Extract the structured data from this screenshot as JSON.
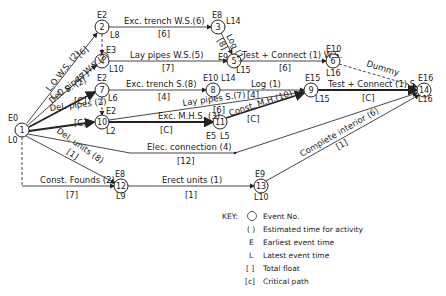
{
  "diagram": {
    "type": "activity-on-arrow network (critical path analysis)",
    "nodes": [
      {
        "id": "1",
        "e": "E0",
        "l": "L0",
        "x": 22,
        "y": 130
      },
      {
        "id": "2",
        "e": "E2",
        "l": "L8",
        "x": 102,
        "y": 27
      },
      {
        "id": "4",
        "e": "E3",
        "l": "L10",
        "x": 102,
        "y": 61
      },
      {
        "id": "7",
        "e": "E2",
        "l": "L6",
        "x": 102,
        "y": 90
      },
      {
        "id": "10",
        "e": "E2",
        "l": "L2",
        "x": 102,
        "y": 122
      },
      {
        "id": "3",
        "e": "E8",
        "l": "L14",
        "x": 218,
        "y": 27
      },
      {
        "id": "5",
        "e": "E9",
        "l": "L15",
        "x": 234,
        "y": 61
      },
      {
        "id": "8",
        "e": "E10",
        "l": "L14",
        "x": 213,
        "y": 90
      },
      {
        "id": "11",
        "e": "E5",
        "l": "L5",
        "x": 220,
        "y": 122
      },
      {
        "id": "6",
        "e": "E10",
        "l": "L16",
        "x": 333,
        "y": 61
      },
      {
        "id": "9",
        "e": "E15",
        "l": "L15",
        "x": 311,
        "y": 90
      },
      {
        "id": "14",
        "e": "E16",
        "l": "L16",
        "x": 424,
        "y": 90
      },
      {
        "id": "12",
        "e": "E8",
        "l": "L9",
        "x": 121,
        "y": 186
      },
      {
        "id": "13",
        "e": "E9",
        "l": "L10",
        "x": 261,
        "y": 186
      }
    ],
    "activities": [
      {
        "from": "1",
        "to": "2",
        "label": "L.O.W.S. (2)",
        "float": "[6]"
      },
      {
        "from": "1",
        "to": "4",
        "label": "Del. pipes W.S.(3)",
        "float": "[7]"
      },
      {
        "from": "1",
        "to": "7",
        "label": "L.O.S. (2)",
        "float": "[C]"
      },
      {
        "from": "1",
        "to": "10",
        "label": "Del. pipes (2)",
        "float": "[C]"
      },
      {
        "from": "1",
        "to": "12",
        "label": "Del. units (8)",
        "float": "[1]"
      },
      {
        "from": "1",
        "to": "12",
        "label": "Const. Founds (2)",
        "float": "[7]"
      },
      {
        "from": "2",
        "to": "3",
        "label": "Exc. trench W.S.(6)",
        "float": "[6]"
      },
      {
        "from": "4",
        "to": "5",
        "label": "Lay pipes W.S.(5)",
        "float": "[7]"
      },
      {
        "from": "3",
        "to": "5",
        "label": "Log (1)",
        "float": "[8]"
      },
      {
        "from": "5",
        "to": "6",
        "label": "Test + Connect (1) W.S.",
        "float": "[6]"
      },
      {
        "from": "6",
        "to": "14",
        "label": "Dummy",
        "float": ""
      },
      {
        "from": "7",
        "to": "8",
        "label": "Exc. trench S.(8)",
        "float": "[4]"
      },
      {
        "from": "8",
        "to": "9",
        "label": "Log (1)",
        "float": "[4]"
      },
      {
        "from": "10",
        "to": "9",
        "label": "Lay pipes S.(7)",
        "float": "[6]"
      },
      {
        "from": "10",
        "to": "11",
        "label": "Exc. M.H.S. (3)",
        "float": "[C]"
      },
      {
        "from": "11",
        "to": "9",
        "label": "Const. M.H.(10)",
        "float": "[C]"
      },
      {
        "from": "9",
        "to": "14",
        "label": "Test + Connect (1) S.",
        "float": "[C]"
      },
      {
        "from": "1",
        "to": "14",
        "label": "Elec. connection (4)",
        "float": "[12]"
      },
      {
        "from": "12",
        "to": "13",
        "label": "Erect units (1)",
        "float": "[1]"
      },
      {
        "from": "13",
        "to": "14",
        "label": "Complete interior (6)",
        "float": "[1]"
      }
    ]
  },
  "key": {
    "title": "KEY:",
    "items": [
      {
        "symbol": "circle",
        "text": "Event No."
      },
      {
        "symbol": "( )",
        "text": "Estimated time for activity"
      },
      {
        "symbol": "E",
        "text": "Earliest event time"
      },
      {
        "symbol": "L",
        "text": "Latest event time"
      },
      {
        "symbol": "[ ]",
        "text": "Total float"
      },
      {
        "symbol": "[c]",
        "text": "Critical path"
      }
    ]
  }
}
